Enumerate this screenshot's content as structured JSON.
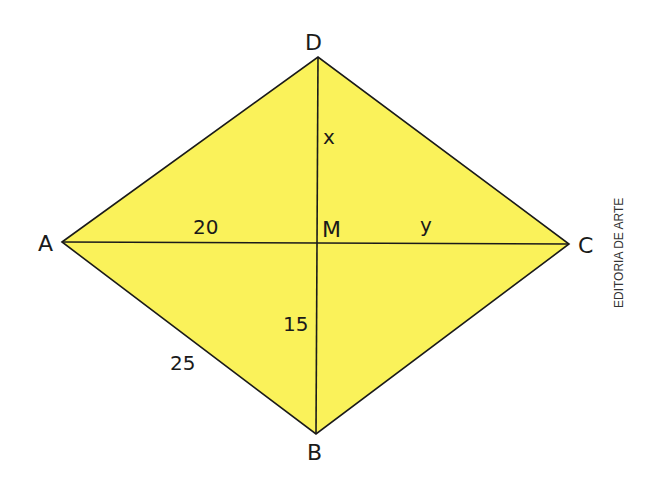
{
  "diagram": {
    "type": "rhombus-with-diagonals",
    "fill_color": "#FAF25A",
    "stroke_color": "#1a1a1a",
    "vertices": {
      "A": {
        "label": "A",
        "x": 62,
        "y": 242
      },
      "B": {
        "label": "B",
        "x": 316,
        "y": 434
      },
      "C": {
        "label": "C",
        "x": 569,
        "y": 244
      },
      "D": {
        "label": "D",
        "x": 318,
        "y": 57
      }
    },
    "center": {
      "label": "M",
      "x": 317,
      "y": 243
    },
    "segment_labels": {
      "AM": "20",
      "MC": "y",
      "DM": "x",
      "MB": "15",
      "AB": "25"
    },
    "credit": "EDITORIA DE ARTE"
  }
}
